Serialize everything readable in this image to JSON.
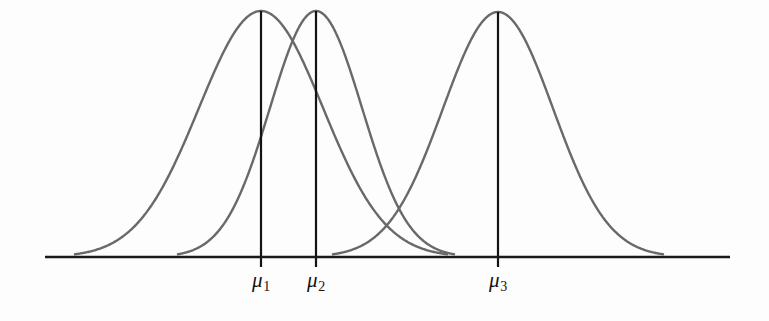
{
  "figure": {
    "name": "three-normal-distributions-diagram",
    "background_color": "#fdfdfd",
    "curve_color": "#696969",
    "axis_color": "#1a1a1a",
    "mean_line_color": "#131313",
    "label_color": "#131313"
  },
  "axis": {
    "name": "horizontal-axis",
    "x_start": 45,
    "x_end": 730,
    "y": 257,
    "stroke_width": 2.6,
    "has_ticks": false,
    "tick_labels": []
  },
  "labels": [
    {
      "text": "μ",
      "subscript": "1",
      "x": 261,
      "y": 270
    },
    {
      "text": "μ",
      "subscript": "2",
      "x": 316,
      "y": 270
    },
    {
      "text": "μ",
      "subscript": "3",
      "x": 498,
      "y": 270
    }
  ],
  "chart_data": {
    "type": "line",
    "title": "",
    "subtitle": "",
    "xlabel": "",
    "ylabel": "",
    "grid": false,
    "legend_position": "none",
    "annotations": [
      "μ₁",
      "μ₂",
      "μ₃"
    ],
    "axis_ranges": {
      "x_pixels": [
        45,
        730
      ],
      "y_baseline_pixel": 257,
      "y_peak_pixel": 11
    },
    "series": [
      {
        "name": "normal-curve-1",
        "distribution": "normal",
        "mean_px": 261,
        "sigma_px": 62,
        "peak_y_px": 11,
        "baseline_y_px": 257,
        "peak_height_px": 246,
        "tail_left_px": 75,
        "tail_right_px": 447,
        "mean_label": "μ₁"
      },
      {
        "name": "normal-curve-2",
        "distribution": "normal",
        "mean_px": 316,
        "sigma_px": 46,
        "peak_y_px": 11,
        "baseline_y_px": 257,
        "peak_height_px": 246,
        "tail_left_px": 178,
        "tail_right_px": 454,
        "mean_label": "μ₂"
      },
      {
        "name": "normal-curve-3",
        "distribution": "normal",
        "mean_px": 498,
        "sigma_px": 55,
        "peak_y_px": 12,
        "baseline_y_px": 257,
        "peak_height_px": 245,
        "tail_left_px": 333,
        "tail_right_px": 663,
        "mean_label": "μ₃"
      }
    ],
    "mean_lines": [
      {
        "name": "mean-line-1",
        "x_px": 261,
        "y_top_px": 11,
        "y_bottom_px": 267
      },
      {
        "name": "mean-line-2",
        "x_px": 316,
        "y_top_px": 11,
        "y_bottom_px": 267
      },
      {
        "name": "mean-line-3",
        "x_px": 498,
        "y_top_px": 12,
        "y_bottom_px": 267
      }
    ]
  }
}
